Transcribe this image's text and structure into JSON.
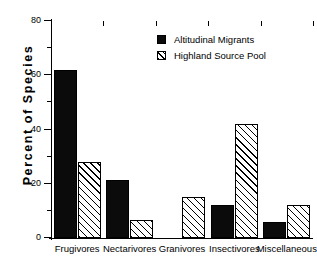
{
  "chart_data": {
    "type": "bar",
    "title": "",
    "xlabel": "",
    "ylabel": "Percent  of  Species",
    "ylim": [
      0,
      80
    ],
    "ytick_values": [
      0,
      20,
      40,
      60,
      80
    ],
    "ytick_labels": [
      "0",
      "20",
      "40",
      "60",
      "80"
    ],
    "yminor_values": [
      10,
      30,
      50,
      70
    ],
    "grid": false,
    "legend_position": "upper right",
    "categories": [
      "Frugivores",
      "Nectarivores",
      "Granivores",
      "Insectivores",
      "Miscellaneous"
    ],
    "series": [
      {
        "name": "Altitudinal Migrants",
        "fill": "solid-black",
        "color": "#0b0b0b",
        "values": [
          62,
          21.5,
          0,
          12,
          6
        ]
      },
      {
        "name": "Highland Source Pool",
        "fill": "diagonal-hatch",
        "color": "#ffffff",
        "values": [
          28,
          6.5,
          15,
          42,
          12
        ]
      }
    ]
  },
  "legend": {
    "entries": [
      {
        "label": "Altitudinal Migrants"
      },
      {
        "label": "Highland Source Pool"
      }
    ]
  }
}
